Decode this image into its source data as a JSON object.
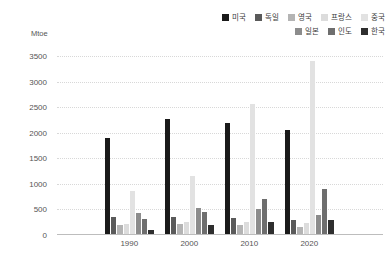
{
  "unit_label": "Mtoe",
  "legend": {
    "items": [
      {
        "label": "미국",
        "color": "#1a1a1a"
      },
      {
        "label": "독일",
        "color": "#5a5a5a"
      },
      {
        "label": "영국",
        "color": "#b4b4b4"
      },
      {
        "label": "프랑스",
        "color": "#dcdcdc"
      },
      {
        "label": "중국",
        "color": "#e2e2e2"
      },
      {
        "label": "일본",
        "color": "#8c8c8c"
      },
      {
        "label": "인도",
        "color": "#6e6e6e"
      },
      {
        "label": "한국",
        "color": "#2e2e2e"
      }
    ]
  },
  "axis": {
    "y_ticks": [
      "0",
      "500",
      "1000",
      "1500",
      "2000",
      "2500",
      "3000",
      "3500"
    ],
    "x_ticks": [
      "1990",
      "2000",
      "2010",
      "2020"
    ]
  },
  "chart_data": {
    "type": "bar",
    "title": "",
    "subtitle": "",
    "xlabel": "",
    "ylabel": "Mtoe",
    "ylim": [
      0,
      3500
    ],
    "ytick_step": 500,
    "grid": true,
    "legend_position": "top-right",
    "categories": [
      "1990",
      "2000",
      "2010",
      "2020"
    ],
    "series": [
      {
        "name": "미국",
        "color": "#1a1a1a",
        "values": [
          1900,
          2270,
          2200,
          2050
        ]
      },
      {
        "name": "독일",
        "color": "#5a5a5a",
        "values": [
          350,
          345,
          330,
          295
        ]
      },
      {
        "name": "영국",
        "color": "#b4b4b4",
        "values": [
          205,
          225,
          200,
          165
        ]
      },
      {
        "name": "프랑스",
        "color": "#dcdcdc",
        "values": [
          225,
          255,
          250,
          230
        ]
      },
      {
        "name": "중국",
        "color": "#e2e2e2",
        "values": [
          870,
          1150,
          2560,
          3400
        ]
      },
      {
        "name": "일본",
        "color": "#8c8c8c",
        "values": [
          440,
          520,
          500,
          400
        ]
      },
      {
        "name": "인도",
        "color": "#6e6e6e",
        "values": [
          305,
          450,
          700,
          900
        ]
      },
      {
        "name": "한국",
        "color": "#2e2e2e",
        "values": [
          90,
          190,
          250,
          290
        ]
      }
    ]
  }
}
